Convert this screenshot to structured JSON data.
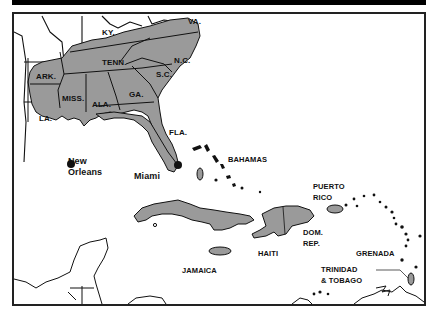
{
  "header": {
    "title_visible": false,
    "background": "#000000"
  },
  "colors": {
    "land_highlight": "#9a9a9a",
    "land_plain": "#ffffff",
    "outline": "#111111",
    "water": "#ffffff"
  },
  "states": {
    "ky": "KY.",
    "va": "VA.",
    "tenn": "TENN.",
    "nc": "N.C.",
    "ark": "ARK.",
    "sc": "S.C.",
    "miss": "MISS.",
    "ala": "ALA.",
    "ga": "GA.",
    "la": "LA.",
    "fla": "FLA."
  },
  "cities": {
    "new_orleans_line1": "New",
    "new_orleans_line2": "Orleans",
    "miami": "Miami"
  },
  "islands": {
    "bahamas": "BAHAMAS",
    "puerto_rico_line1": "PUERTO",
    "puerto_rico_line2": "RICO",
    "haiti": "HAITI",
    "dom_rep_line1": "DOM.",
    "dom_rep_line2": "REP.",
    "jamaica": "JAMAICA",
    "grenada": "GRENADA",
    "trinidad_line1": "TRINIDAD",
    "trinidad_line2": "& TOBAGO"
  }
}
